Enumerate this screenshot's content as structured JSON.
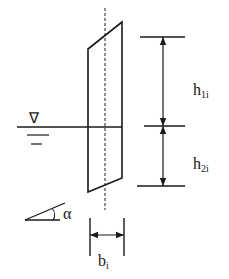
{
  "diagram": {
    "labels": {
      "water_symbol": "∇",
      "h1_main": "h",
      "h1_sub": "1i",
      "h2_main": "h",
      "h2_sub": "2i",
      "angle": "α",
      "b_main": "b",
      "b_sub": "i"
    },
    "colors": {
      "stroke": "#1a1a1a",
      "background": "#ffffff"
    }
  }
}
